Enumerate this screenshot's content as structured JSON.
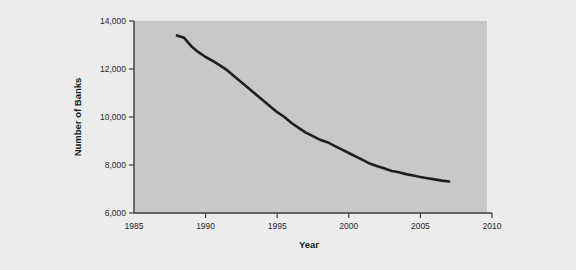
{
  "figure": {
    "background_color": "#ececec",
    "plot_background_color": "#c8c8c8",
    "axis_color": "#3c3c3c",
    "line_color": "#1f1f1f"
  },
  "chart_data": {
    "type": "line",
    "title": "",
    "xlabel": "Year",
    "ylabel": "Number of Banks",
    "xlim": [
      1985,
      2010
    ],
    "ylim": [
      6000,
      14000
    ],
    "xticks": [
      1985,
      1990,
      1995,
      2000,
      2005,
      2010
    ],
    "xtick_labels": [
      "1985",
      "1990",
      "1995",
      "2000",
      "2005",
      "2010"
    ],
    "yticks": [
      6000,
      8000,
      10000,
      12000,
      14000
    ],
    "ytick_labels": [
      "6,000",
      "8,000",
      "10,000",
      "12,000",
      "14,000"
    ],
    "grid": false,
    "legend": false,
    "series": [
      {
        "name": "Number of Banks",
        "x": [
          1988,
          1988.5,
          1989,
          1989.5,
          1990,
          1990.5,
          1991,
          1991.5,
          1992,
          1992.5,
          1993,
          1993.5,
          1994,
          1994.5,
          1995,
          1995.5,
          1996,
          1996.5,
          1997,
          1997.5,
          1998,
          1998.5,
          1999,
          1999.5,
          2000,
          2000.5,
          2001,
          2001.5,
          2002,
          2002.5,
          2003,
          2003.5,
          2004,
          2004.5,
          2005,
          2005.5,
          2006,
          2006.5,
          2007
        ],
        "values": [
          13400,
          13300,
          12950,
          12700,
          12500,
          12340,
          12150,
          11950,
          11700,
          11450,
          11200,
          10950,
          10700,
          10450,
          10200,
          10000,
          9750,
          9550,
          9350,
          9200,
          9050,
          8950,
          8800,
          8650,
          8500,
          8350,
          8200,
          8050,
          7950,
          7850,
          7750,
          7700,
          7620,
          7560,
          7500,
          7450,
          7400,
          7350,
          7310
        ]
      }
    ]
  },
  "axis_titles": {
    "x": "Year",
    "y": "Number of Banks"
  }
}
